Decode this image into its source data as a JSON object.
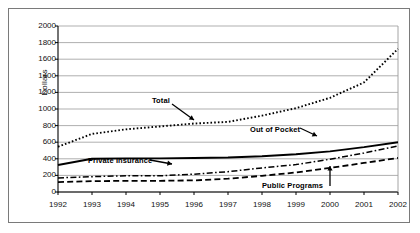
{
  "figure": {
    "ylabel": "Dollars",
    "border": "#7a7a7a",
    "gridcolor": "#a6a6a6",
    "axiscolor": "#000000"
  },
  "annotations": {
    "total": "Total",
    "out_of_pocket": "Out of Pocket",
    "private_insurance": "Private Insurance",
    "public_programs": "Public Programs"
  },
  "chart_data": {
    "type": "line",
    "title": "",
    "xlabel": "",
    "ylabel": "Dollars",
    "ylim": [
      0,
      2000
    ],
    "ytick_step": 200,
    "yticks": [
      0,
      200,
      400,
      600,
      800,
      1000,
      1200,
      1400,
      1600,
      1800,
      2000
    ],
    "grid": true,
    "legend": "none (inline arrow annotations)",
    "categories": [
      1992,
      1993,
      1994,
      1995,
      1996,
      1997,
      1998,
      1999,
      2000,
      2001,
      2002
    ],
    "series": [
      {
        "name": "Total",
        "style": "dotted",
        "color": "#000000",
        "values": [
          545,
          700,
          755,
          790,
          825,
          845,
          920,
          1010,
          1135,
          1320,
          1725
        ]
      },
      {
        "name": "Out of Pocket",
        "style": "solid",
        "color": "#000000",
        "values": [
          325,
          400,
          405,
          405,
          410,
          415,
          430,
          455,
          490,
          540,
          600
        ]
      },
      {
        "name": "Private Insurance",
        "style": "dash-dot",
        "color": "#000000",
        "values": [
          170,
          185,
          195,
          195,
          215,
          245,
          290,
          330,
          395,
          470,
          555
        ]
      },
      {
        "name": "Public Programs",
        "style": "dashed",
        "color": "#000000",
        "values": [
          120,
          130,
          135,
          135,
          140,
          160,
          195,
          235,
          290,
          350,
          410
        ]
      }
    ]
  }
}
